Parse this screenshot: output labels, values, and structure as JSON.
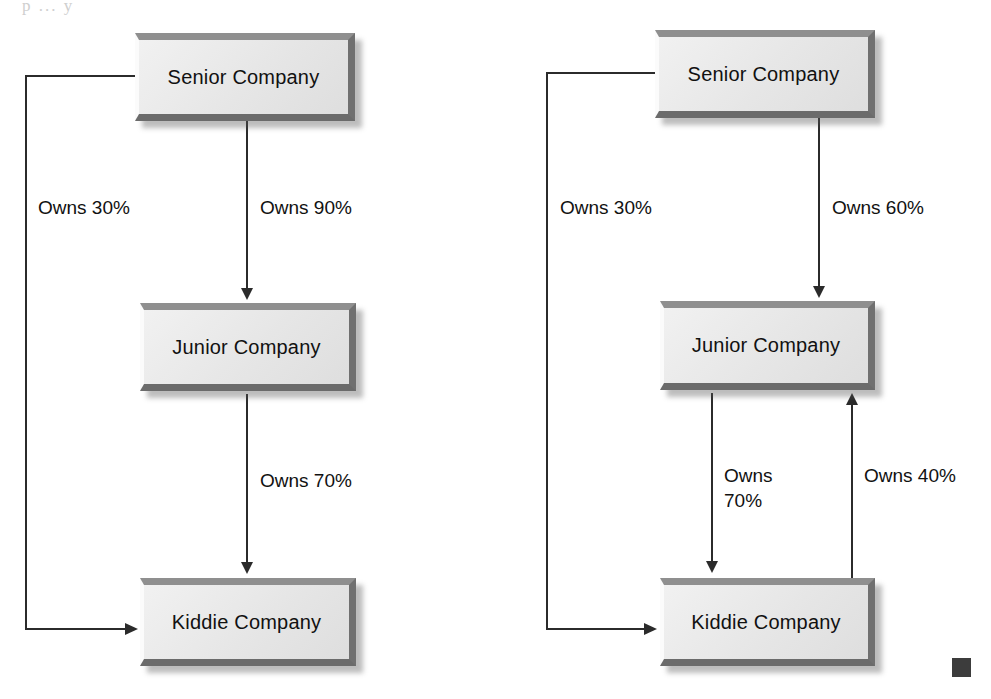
{
  "page": {
    "bleed_text": "p   ...   y",
    "width": 991,
    "height": 699,
    "background": "#ffffff",
    "line_color": "#2b2b2b",
    "box_fill": "#e9e9e9",
    "box_bevel_dark": "#6b6b6b",
    "box_bevel_light": "#fbfbfb",
    "text_color": "#111111",
    "end_marker_color": "#3c3c3c"
  },
  "diagrams": [
    {
      "id": "left-diagram",
      "name": "direct-and-indirect-ownership",
      "nodes": [
        {
          "id": "senior",
          "label": "Senior Company"
        },
        {
          "id": "junior",
          "label": "Junior Company"
        },
        {
          "id": "kiddie",
          "label": "Kiddie Company"
        }
      ],
      "edges": [
        {
          "id": "senior-junior",
          "from": "Senior Company",
          "to": "Junior Company",
          "label": "Owns 90%",
          "percent": 90,
          "direction": "down"
        },
        {
          "id": "junior-kiddie",
          "from": "Junior Company",
          "to": "Kiddie Company",
          "label": "Owns 70%",
          "percent": 70,
          "direction": "down"
        },
        {
          "id": "senior-kiddie",
          "from": "Senior Company",
          "to": "Kiddie Company",
          "label": "Owns 30%",
          "percent": 30,
          "direction": "left-around"
        }
      ]
    },
    {
      "id": "right-diagram",
      "name": "reciprocal-ownership",
      "nodes": [
        {
          "id": "senior",
          "label": "Senior Company"
        },
        {
          "id": "junior",
          "label": "Junior Company"
        },
        {
          "id": "kiddie",
          "label": "Kiddie Company"
        }
      ],
      "edges": [
        {
          "id": "senior-junior",
          "from": "Senior Company",
          "to": "Junior Company",
          "label": "Owns 60%",
          "percent": 60,
          "direction": "down"
        },
        {
          "id": "junior-kiddie",
          "from": "Junior Company",
          "to": "Kiddie Company",
          "label": "Owns\n70%",
          "percent": 70,
          "direction": "down"
        },
        {
          "id": "kiddie-junior",
          "from": "Kiddie Company",
          "to": "Junior Company",
          "label": "Owns 40%",
          "percent": 40,
          "direction": "up"
        },
        {
          "id": "senior-kiddie",
          "from": "Senior Company",
          "to": "Kiddie Company",
          "label": "Owns 30%",
          "percent": 30,
          "direction": "left-around"
        }
      ]
    }
  ],
  "end_marker": {
    "shape": "filled-square",
    "label": ""
  }
}
